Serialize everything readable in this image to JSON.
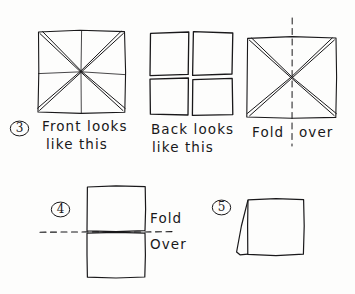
{
  "figure": {
    "kind": "hand-drawn paper folding instructions",
    "ink_color": "#19181a",
    "paper_color": "#fdfdfc"
  },
  "steps": [
    {
      "number": "3",
      "number_glyph": "3",
      "captions": [
        {
          "line1": "Front looks",
          "line2": "like this"
        },
        {
          "line1": "Back looks",
          "line2": "like this"
        },
        {
          "line1": "Fold",
          "line2": "over"
        }
      ]
    },
    {
      "number": "4",
      "number_glyph": "4",
      "labels": {
        "fold": "Fold",
        "over": "Over"
      }
    },
    {
      "number": "5",
      "number_glyph": "5",
      "labels": {}
    }
  ],
  "captions": {
    "front_line1": "Front looks",
    "front_line2": "like this",
    "back_line1": "Back looks",
    "back_line2": "like this",
    "fold_word": "Fold",
    "over_word": "over",
    "fold_word_cap": "Fold",
    "over_word_cap": "Over"
  },
  "step_numbers": {
    "three": "3",
    "four": "4",
    "five": "5"
  },
  "diagrams": {
    "front_square": {
      "name": "square-with-doubled-diagonals-and-center-cross",
      "creases": [
        "diagonal-tl-br",
        "diagonal-tr-bl",
        "vertical-center",
        "horizontal-center"
      ]
    },
    "back_square": {
      "name": "square-split-into-four-panes",
      "creases": [
        "vertical-gap",
        "horizontal-gap"
      ]
    },
    "fold_square": {
      "name": "square-with-doubled-diagonals-and-vertical-dashed-fold-line",
      "creases": [
        "diagonal-tl-br",
        "diagonal-tr-bl"
      ],
      "fold_line": "vertical-dashed"
    },
    "step4_rect": {
      "name": "tall-rectangle-with-horizontal-dashed-fold-line",
      "fold_line": "horizontal-dashed"
    },
    "step5_shape": {
      "name": "square-with-left-folded-flap"
    }
  }
}
